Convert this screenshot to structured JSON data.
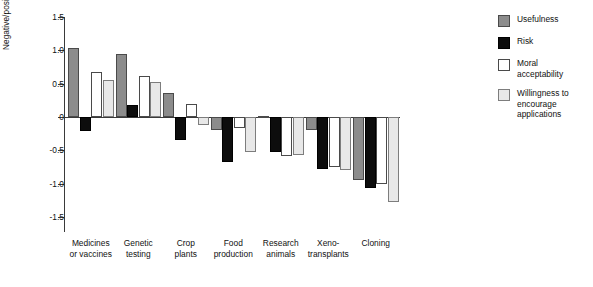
{
  "chart_data": {
    "type": "bar",
    "title": "",
    "xlabel": "",
    "ylabel": "Negative/positive evaluation",
    "ylim": [
      -1.5,
      1.5
    ],
    "yticks": [
      "1.5",
      "1.0",
      "0.5",
      "0",
      "-0.5",
      "-1.0",
      "-1.5"
    ],
    "ytick_values": [
      1.5,
      1.0,
      0.5,
      0,
      -0.5,
      -1.0,
      -1.5
    ],
    "grid": false,
    "legend_position": "right",
    "categories": [
      "Medicines\nor vaccines",
      "Genetic\ntesting",
      "Crop\nplants",
      "Food\nproduction",
      "Research\nanimals",
      "Xeno-\ntransplants",
      "Cloning"
    ],
    "category_lines": [
      [
        "Medicines",
        "or vaccines"
      ],
      [
        "Genetic",
        "testing"
      ],
      [
        "Crop",
        "plants"
      ],
      [
        "Food",
        "production"
      ],
      [
        "Research",
        "animals"
      ],
      [
        "Xeno-",
        "transplants"
      ],
      [
        "Cloning"
      ]
    ],
    "series": [
      {
        "name": "Usefulness",
        "key": "usefulness",
        "color": "#8c8c8c",
        "values": [
          1.03,
          0.95,
          0.36,
          -0.19,
          0.02,
          -0.2,
          -0.95
        ]
      },
      {
        "name": "Risk",
        "key": "risk",
        "color": "#0d0d0d",
        "values": [
          -0.21,
          0.18,
          -0.35,
          -0.68,
          -0.52,
          -0.78,
          -1.07
        ]
      },
      {
        "name": "Moral acceptability",
        "key": "moral",
        "color": "#ffffff",
        "values": [
          0.68,
          0.61,
          0.19,
          -0.17,
          -0.58,
          -0.75,
          -1.0
        ]
      },
      {
        "name": "Willingness to encourage applications",
        "key": "willing",
        "color": "#e8e8e8",
        "values": [
          0.56,
          0.53,
          -0.12,
          -0.52,
          -0.57,
          -0.8,
          -1.28
        ]
      }
    ]
  },
  "legend": {
    "entries": [
      {
        "label": "Usefulness",
        "lines": [
          "Usefulness"
        ],
        "key": "usefulness"
      },
      {
        "label": "Risk",
        "lines": [
          "Risk"
        ],
        "key": "risk"
      },
      {
        "label": "Moral acceptability",
        "lines": [
          "Moral",
          "acceptability"
        ],
        "key": "moral"
      },
      {
        "label": "Willingness to encourage applications",
        "lines": [
          "Willingness to",
          "encourage",
          "applications"
        ],
        "key": "willing"
      }
    ]
  }
}
